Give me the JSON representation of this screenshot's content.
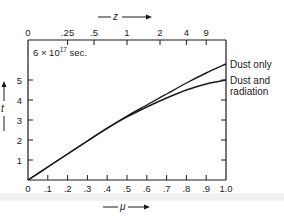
{
  "chart_data": {
    "type": "line",
    "title": "",
    "xlabel": "μ",
    "ylabel": "t",
    "top_xlabel": "z",
    "y_unit_label": "6 × 10¹⁷ sec.",
    "xlim": [
      0,
      1.0
    ],
    "ylim": [
      0,
      6
    ],
    "grid": false,
    "legend_position": "right, inline at curve ends",
    "x_ticks": [
      0,
      0.1,
      0.2,
      0.3,
      0.4,
      0.5,
      0.6,
      0.7,
      0.8,
      0.9,
      1.0
    ],
    "x_tick_labels": [
      "0",
      ".1",
      ".2",
      ".3",
      ".4",
      ".5",
      ".6",
      ".7",
      ".8",
      ".9",
      "1.0"
    ],
    "y_ticks": [
      1,
      2,
      3,
      4,
      5
    ],
    "y_tick_labels": [
      "1",
      "2",
      "3",
      "4",
      "5"
    ],
    "top_axis": {
      "label": "z",
      "ticks": [
        {
          "label": "0",
          "mu": 0.0
        },
        {
          "label": ".25",
          "mu": 0.2
        },
        {
          "label": ".5",
          "mu": 0.3333
        },
        {
          "label": "1",
          "mu": 0.5
        },
        {
          "label": "2",
          "mu": 0.6667
        },
        {
          "label": "4",
          "mu": 0.8
        },
        {
          "label": "9",
          "mu": 0.9
        }
      ]
    },
    "x": [
      0,
      0.1,
      0.2,
      0.3,
      0.4,
      0.5,
      0.6,
      0.7,
      0.8,
      0.9,
      1.0
    ],
    "series": [
      {
        "name": "Dust only",
        "values": [
          0,
          0.65,
          1.3,
          1.95,
          2.6,
          3.2,
          3.75,
          4.3,
          4.85,
          5.35,
          5.8
        ]
      },
      {
        "name": "Dust and radiation",
        "values": [
          0,
          0.65,
          1.3,
          1.95,
          2.58,
          3.15,
          3.65,
          4.1,
          4.5,
          4.8,
          5.0
        ]
      }
    ]
  },
  "labels": {
    "top_axis_title": "z",
    "bottom_axis_title": "μ",
    "left_axis_title": "t",
    "unit": "6 × 10",
    "unit_exp": "17",
    "unit_suffix": " sec.",
    "legend_dust_only": "Dust only",
    "legend_dust_rad_1": "Dust and",
    "legend_dust_rad_2": "radiation"
  }
}
